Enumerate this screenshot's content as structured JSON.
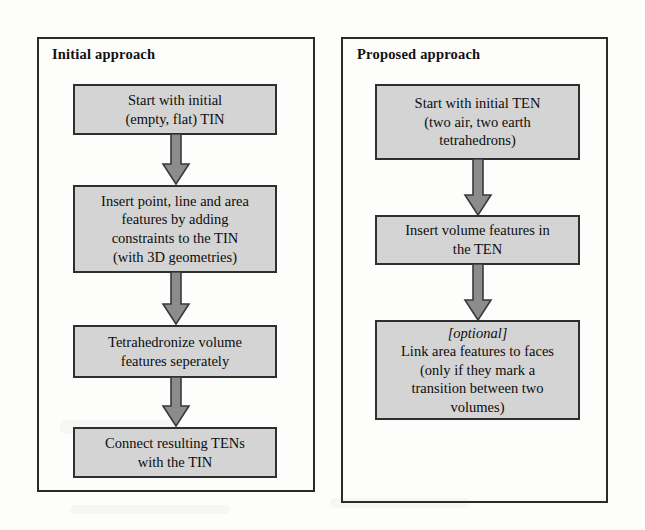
{
  "diagram": {
    "panels": [
      {
        "id": "initial",
        "title": "Initial approach",
        "nodes": [
          {
            "id": "i1",
            "text": "Start with initial\n(empty, flat) TIN"
          },
          {
            "id": "i2",
            "text": "Insert point, line and area\nfeatures by adding\nconstraints to the TIN\n(with 3D geometries)"
          },
          {
            "id": "i3",
            "text": "Tetrahedronize volume\nfeatures seperately"
          },
          {
            "id": "i4",
            "text": "Connect resulting TENs\nwith the TIN"
          }
        ],
        "arrows": [
          {
            "id": "ia1",
            "from": "i1",
            "to": "i2"
          },
          {
            "id": "ia2",
            "from": "i2",
            "to": "i3"
          },
          {
            "id": "ia3",
            "from": "i3",
            "to": "i4"
          }
        ]
      },
      {
        "id": "proposed",
        "title": "Proposed approach",
        "nodes": [
          {
            "id": "p1",
            "text": "Start with initial TEN\n(two air, two earth\ntetrahedrons)"
          },
          {
            "id": "p2",
            "text": "Insert volume features in\nthe TEN"
          },
          {
            "id": "p3",
            "optional_label": "[optional]",
            "text": "Link area features to faces\n(only if they mark a\ntransition between two\nvolumes)"
          }
        ],
        "arrows": [
          {
            "id": "pa1",
            "from": "p1",
            "to": "p2"
          },
          {
            "id": "pa2",
            "from": "p2",
            "to": "p3"
          }
        ]
      }
    ],
    "colors": {
      "node_fill": "#d4d4d4",
      "node_border": "#2f2f2f",
      "panel_border": "#2b2b2b",
      "arrow_fill": "#8c8c8c",
      "arrow_border": "#3a3a3a",
      "text": "#0d0d0d",
      "background": "#fdfdfc"
    }
  }
}
